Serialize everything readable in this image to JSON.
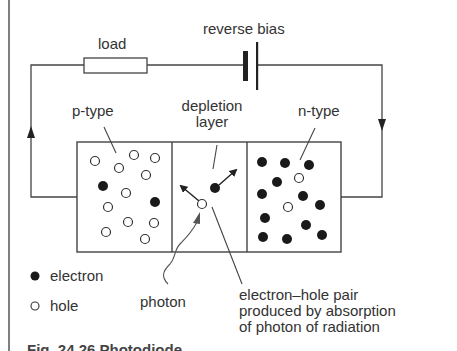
{
  "diagram": {
    "labels": {
      "load": "load",
      "reverse_bias": "reverse bias",
      "p_type": "p-type",
      "depletion_1": "depletion",
      "depletion_2": "layer",
      "n_type": "n-type",
      "pair_1": "electron–hole pair",
      "pair_2": "produced by absorption",
      "pair_3": "of photon of radiation",
      "photon": "photon"
    },
    "legend": {
      "electron": "electron",
      "hole": "hole"
    },
    "caption": "Fig. 24.26  Photodiode"
  },
  "colors": {
    "line": "#444444",
    "text": "#333333",
    "particle": "#222222",
    "background": "#ffffff"
  }
}
